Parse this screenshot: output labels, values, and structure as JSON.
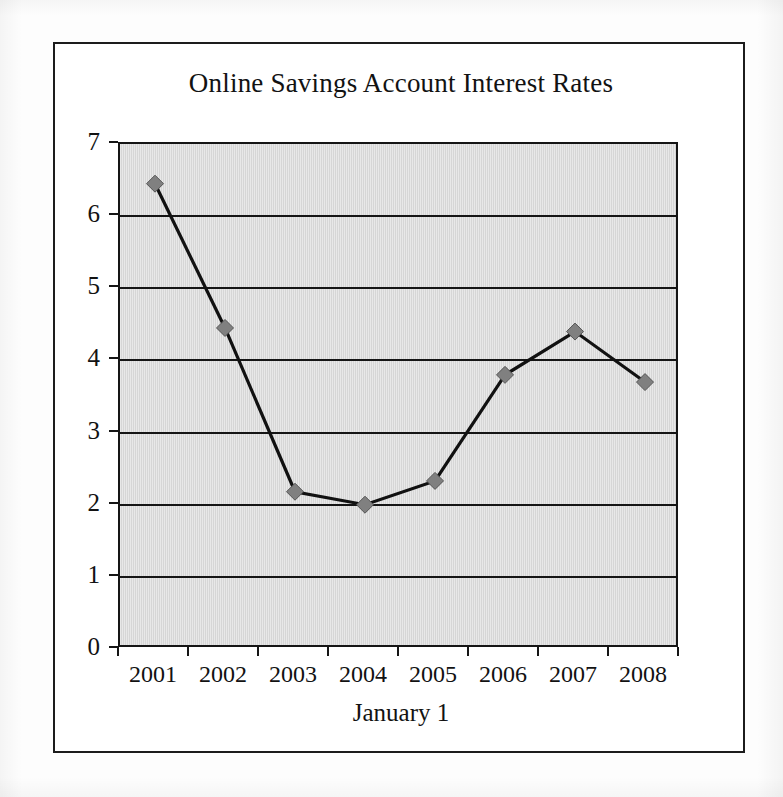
{
  "figure": {
    "title": "Online Savings Account Interest Rates",
    "xaxis_title": "January 1",
    "ytick_labels": [
      "7",
      "6",
      "5",
      "4",
      "3",
      "2",
      "1",
      "0"
    ],
    "xtick_labels": [
      "2001",
      "2002",
      "2003",
      "2004",
      "2005",
      "2006",
      "2007",
      "2008"
    ],
    "colors": {
      "plot_background": "#d6d6d6",
      "axis": "#151515",
      "gridline": "#151515",
      "line": "#111111",
      "marker_fill": "#808080",
      "marker_stroke": "#555555",
      "frame": "#1c1c1c",
      "text": "#121212"
    }
  },
  "chart_data": {
    "type": "line",
    "title": "Online Savings Account Interest Rates",
    "xlabel": "January 1",
    "ylabel": "",
    "categories": [
      "2001",
      "2002",
      "2003",
      "2004",
      "2005",
      "2006",
      "2007",
      "2008"
    ],
    "values": [
      6.45,
      4.45,
      2.18,
      2.0,
      2.33,
      3.8,
      4.4,
      3.7
    ],
    "ylim": [
      0,
      7
    ],
    "ytick_values": [
      0,
      1,
      2,
      3,
      4,
      5,
      6,
      7
    ],
    "grid": true,
    "grid_axis": "y",
    "legend": false,
    "legend_position": "none",
    "marker": "diamond",
    "series": [
      {
        "name": "Interest Rate",
        "values": [
          6.45,
          4.45,
          2.18,
          2.0,
          2.33,
          3.8,
          4.4,
          3.7
        ]
      }
    ]
  }
}
